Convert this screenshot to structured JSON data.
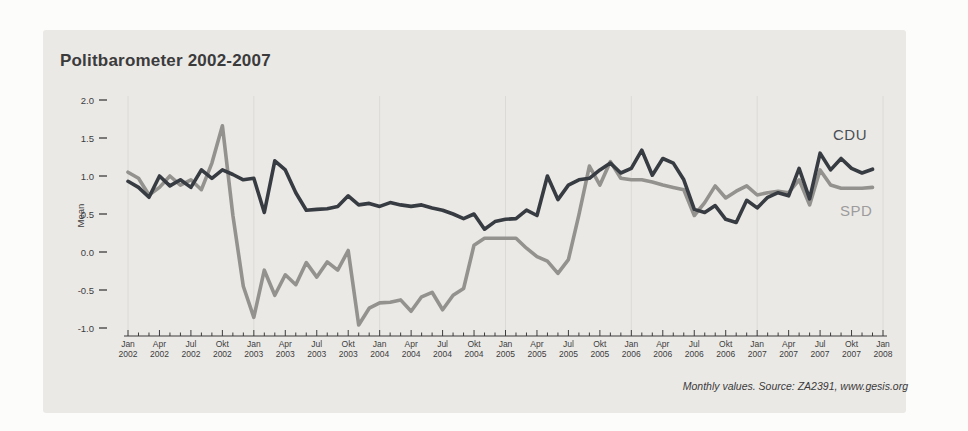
{
  "colors": {
    "page_bg": "#fcfcfa",
    "panel_bg": "#ebe9e6",
    "grid": "#dcdad6",
    "axis": "#3d3d3d",
    "title_text": "#3b3b3c",
    "cdu_line": "#373b42",
    "spd_line": "#94928f",
    "cdu_label": "#4a4e55",
    "spd_label": "#9c9c9c"
  },
  "chart_data": {
    "type": "line",
    "title": "Politbarometer 2002-2007",
    "ylabel": "Mean",
    "caption": "Monthly values. Source: ZA2391, www.gesis.org",
    "ylim": [
      -1.0,
      2.0
    ],
    "grid": "faint vertical line at each January",
    "legend_position": "inline-right of lines",
    "y_ticks": [
      {
        "label": "2.0",
        "value": 2.0
      },
      {
        "label": "1.5",
        "value": 1.5
      },
      {
        "label": "1.0",
        "value": 1.0
      },
      {
        "label": "0.5",
        "value": 0.5
      },
      {
        "label": "0.0",
        "value": 0.0
      },
      {
        "label": "-0.5",
        "value": -0.5
      },
      {
        "label": "-1.0",
        "value": -1.0
      }
    ],
    "x_unit": "month",
    "x_range": [
      "Jan 2002",
      "Jan 2008"
    ],
    "x_major_tick_every_months": 3,
    "x_minor_tick_every_months": 1,
    "x_ticks": [
      {
        "month": "Jan",
        "year": "2002"
      },
      {
        "month": "Apr",
        "year": "2002"
      },
      {
        "month": "Jul",
        "year": "2002"
      },
      {
        "month": "Okt",
        "year": "2002"
      },
      {
        "month": "Jan",
        "year": "2003"
      },
      {
        "month": "Apr",
        "year": "2003"
      },
      {
        "month": "Jul",
        "year": "2003"
      },
      {
        "month": "Okt",
        "year": "2003"
      },
      {
        "month": "Jan",
        "year": "2004"
      },
      {
        "month": "Apr",
        "year": "2004"
      },
      {
        "month": "Jul",
        "year": "2004"
      },
      {
        "month": "Okt",
        "year": "2004"
      },
      {
        "month": "Jan",
        "year": "2005"
      },
      {
        "month": "Apr",
        "year": "2005"
      },
      {
        "month": "Jul",
        "year": "2005"
      },
      {
        "month": "Okt",
        "year": "2005"
      },
      {
        "month": "Jan",
        "year": "2006"
      },
      {
        "month": "Apr",
        "year": "2006"
      },
      {
        "month": "Jul",
        "year": "2006"
      },
      {
        "month": "Okt",
        "year": "2006"
      },
      {
        "month": "Jan",
        "year": "2007"
      },
      {
        "month": "Apr",
        "year": "2007"
      },
      {
        "month": "Jul",
        "year": "2007"
      },
      {
        "month": "Okt",
        "year": "2007"
      },
      {
        "month": "Jan",
        "year": "2008"
      }
    ],
    "series": [
      {
        "name": "CDU",
        "color": "#373b42",
        "label_color": "#4a4e55",
        "values": [
          0.93,
          0.85,
          0.72,
          1.0,
          0.87,
          0.95,
          0.85,
          1.08,
          0.97,
          1.08,
          1.02,
          0.95,
          0.97,
          0.52,
          1.2,
          1.08,
          0.78,
          0.55,
          0.56,
          0.57,
          0.6,
          0.74,
          0.62,
          0.64,
          0.6,
          0.65,
          0.62,
          0.6,
          0.62,
          0.58,
          0.55,
          0.5,
          0.44,
          0.5,
          0.3,
          0.4,
          0.43,
          0.44,
          0.55,
          0.48,
          1.0,
          0.69,
          0.88,
          0.95,
          0.97,
          1.08,
          1.17,
          1.04,
          1.1,
          1.34,
          1.01,
          1.23,
          1.17,
          0.95,
          0.56,
          0.52,
          0.61,
          0.43,
          0.39,
          0.68,
          0.58,
          0.72,
          0.78,
          0.74,
          1.1,
          0.7,
          1.3,
          1.08,
          1.23,
          1.1,
          1.04,
          1.09
        ]
      },
      {
        "name": "SPD",
        "color": "#94928f",
        "label_color": "#9c9c9c",
        "values": [
          1.05,
          0.97,
          0.75,
          0.85,
          1.0,
          0.88,
          0.95,
          0.82,
          1.17,
          1.66,
          0.48,
          -0.45,
          -0.86,
          -0.24,
          -0.57,
          -0.3,
          -0.43,
          -0.14,
          -0.33,
          -0.13,
          -0.24,
          0.02,
          -0.96,
          -0.74,
          -0.67,
          -0.66,
          -0.63,
          -0.78,
          -0.59,
          -0.53,
          -0.76,
          -0.57,
          -0.48,
          0.09,
          0.18,
          0.18,
          0.18,
          0.18,
          0.05,
          -0.06,
          -0.12,
          -0.28,
          -0.1,
          0.49,
          1.13,
          0.88,
          1.19,
          0.97,
          0.95,
          0.95,
          0.92,
          0.88,
          0.85,
          0.82,
          0.48,
          0.65,
          0.87,
          0.71,
          0.8,
          0.87,
          0.75,
          0.78,
          0.8,
          0.78,
          0.95,
          0.62,
          1.08,
          0.88,
          0.84,
          0.84,
          0.84,
          0.85
        ]
      }
    ]
  }
}
